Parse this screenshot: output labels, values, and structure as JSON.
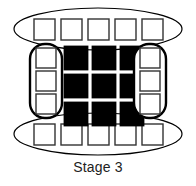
{
  "figure": {
    "caption": "Stage 3",
    "background_color": "#ffffff",
    "outline_color": "#000000",
    "filled_color": "#000000",
    "empty_color": "#ffffff",
    "caption_color": "#222222"
  },
  "diagram": {
    "type": "stage-schematic",
    "stage_number": 3,
    "groups": [
      {
        "id": "top-ellipse",
        "shape": "ellipse",
        "orientation": "horizontal",
        "cell_count": 5,
        "cell_fill": "empty",
        "cx": 98,
        "cy": 29,
        "rx": 84,
        "ry": 21
      },
      {
        "id": "left-capsule",
        "shape": "rounded-rect",
        "orientation": "vertical",
        "cell_count": 3,
        "cell_fill": "empty",
        "x": 30,
        "y": 44,
        "width": 32,
        "height": 74,
        "radius": 15
      },
      {
        "id": "center-grid",
        "shape": "grid",
        "rows": 3,
        "cols": 3,
        "cell_fill": "filled",
        "cell_count": 9
      },
      {
        "id": "right-capsule",
        "shape": "rounded-rect",
        "orientation": "vertical",
        "cell_count": 3,
        "cell_fill": "empty",
        "x": 134,
        "y": 44,
        "width": 32,
        "height": 74,
        "radius": 15
      },
      {
        "id": "bottom-ellipse",
        "shape": "ellipse",
        "orientation": "horizontal",
        "cell_count": 5,
        "cell_fill": "empty",
        "cx": 98,
        "cy": 134,
        "rx": 84,
        "ry": 21
      }
    ],
    "top_cells": [
      {
        "x": 34,
        "y": 19,
        "w": 21,
        "h": 21,
        "fill": "empty"
      },
      {
        "x": 61,
        "y": 19,
        "w": 21,
        "h": 21,
        "fill": "empty"
      },
      {
        "x": 88,
        "y": 19,
        "w": 21,
        "h": 21,
        "fill": "empty"
      },
      {
        "x": 115,
        "y": 19,
        "w": 21,
        "h": 21,
        "fill": "empty"
      },
      {
        "x": 142,
        "y": 19,
        "w": 21,
        "h": 21,
        "fill": "empty"
      }
    ],
    "left_cells": [
      {
        "x": 36,
        "y": 48,
        "w": 20,
        "h": 20,
        "fill": "empty"
      },
      {
        "x": 36,
        "y": 71,
        "w": 20,
        "h": 20,
        "fill": "empty"
      },
      {
        "x": 36,
        "y": 94,
        "w": 20,
        "h": 20,
        "fill": "empty"
      }
    ],
    "center_cells": [
      {
        "x": 64,
        "y": 46,
        "w": 24,
        "h": 24,
        "fill": "filled"
      },
      {
        "x": 92,
        "y": 46,
        "w": 24,
        "h": 24,
        "fill": "filled"
      },
      {
        "x": 120,
        "y": 46,
        "w": 24,
        "h": 24,
        "fill": "filled"
      },
      {
        "x": 64,
        "y": 74,
        "w": 24,
        "h": 24,
        "fill": "filled"
      },
      {
        "x": 92,
        "y": 74,
        "w": 24,
        "h": 24,
        "fill": "filled"
      },
      {
        "x": 120,
        "y": 74,
        "w": 24,
        "h": 24,
        "fill": "filled"
      },
      {
        "x": 64,
        "y": 102,
        "w": 24,
        "h": 24,
        "fill": "filled"
      },
      {
        "x": 92,
        "y": 102,
        "w": 24,
        "h": 24,
        "fill": "filled"
      },
      {
        "x": 120,
        "y": 102,
        "w": 24,
        "h": 24,
        "fill": "filled"
      }
    ],
    "right_cells": [
      {
        "x": 140,
        "y": 48,
        "w": 20,
        "h": 20,
        "fill": "empty"
      },
      {
        "x": 140,
        "y": 71,
        "w": 20,
        "h": 20,
        "fill": "empty"
      },
      {
        "x": 140,
        "y": 94,
        "w": 20,
        "h": 20,
        "fill": "empty"
      }
    ],
    "bottom_cells": [
      {
        "x": 34,
        "y": 124,
        "w": 21,
        "h": 21,
        "fill": "empty"
      },
      {
        "x": 61,
        "y": 124,
        "w": 21,
        "h": 21,
        "fill": "empty"
      },
      {
        "x": 88,
        "y": 124,
        "w": 21,
        "h": 21,
        "fill": "empty"
      },
      {
        "x": 115,
        "y": 124,
        "w": 21,
        "h": 21,
        "fill": "empty"
      },
      {
        "x": 142,
        "y": 124,
        "w": 21,
        "h": 21,
        "fill": "empty"
      }
    ]
  }
}
